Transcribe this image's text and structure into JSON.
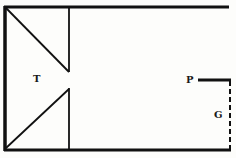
{
  "diagram": {
    "labels": {
      "t": "T",
      "p": "P",
      "g": "G"
    },
    "colors": {
      "ink": "#111111",
      "paper": "#fdfdfb"
    }
  }
}
